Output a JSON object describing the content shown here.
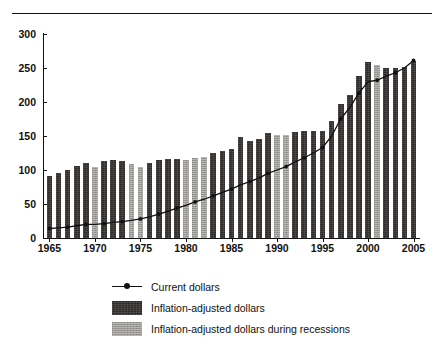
{
  "chart_data": {
    "type": "bar",
    "title": "",
    "subtitle": "",
    "xlabel": "",
    "ylabel": "",
    "xlim": [
      1964.4,
      2005.6
    ],
    "ylim": [
      0,
      300
    ],
    "grid": false,
    "legend_position": "bottom-left",
    "y_ticks": [
      0,
      50,
      100,
      150,
      200,
      250,
      300
    ],
    "x_ticks": [
      1965,
      1970,
      1975,
      1980,
      1985,
      1990,
      1995,
      2000,
      2005
    ],
    "x_tick_labels": [
      "1965",
      "1970",
      "1975",
      "1980",
      "1985",
      "1990",
      "1995",
      "2000",
      "2005"
    ],
    "y_tick_labels": [
      "0",
      "50",
      "100",
      "150",
      "200",
      "250",
      "300"
    ],
    "categories": [
      1965,
      1966,
      1967,
      1968,
      1969,
      1970,
      1971,
      1972,
      1973,
      1974,
      1975,
      1976,
      1977,
      1978,
      1979,
      1980,
      1981,
      1982,
      1983,
      1984,
      1985,
      1986,
      1987,
      1988,
      1989,
      1990,
      1991,
      1992,
      1993,
      1994,
      1995,
      1996,
      1997,
      1998,
      1999,
      2000,
      2001,
      2002,
      2003,
      2004,
      2005
    ],
    "series": [
      {
        "name": "Inflation-adjusted dollars",
        "type": "bar",
        "color": "#2e2b29",
        "values": [
          91,
          95,
          100,
          106,
          110,
          105,
          113,
          115,
          113,
          109,
          104,
          110,
          114,
          116,
          116,
          115,
          117,
          119,
          125,
          128,
          131,
          149,
          143,
          146,
          154,
          151,
          151,
          156,
          157,
          157,
          158,
          172,
          197,
          211,
          238,
          259,
          254,
          250,
          250,
          252,
          261
        ]
      },
      {
        "name": "Current dollars",
        "type": "line",
        "color": "#111111",
        "marker": "diamond",
        "values": [
          14,
          15,
          16,
          18,
          20,
          20,
          21,
          23,
          24,
          26,
          28,
          31,
          35,
          39,
          44,
          48,
          53,
          57,
          62,
          67,
          72,
          78,
          83,
          88,
          95,
          100,
          105,
          112,
          118,
          125,
          133,
          150,
          175,
          192,
          213,
          230,
          232,
          238,
          243,
          250,
          261
        ]
      }
    ],
    "recession_years": [
      1970,
      1974,
      1975,
      1980,
      1981,
      1982,
      1990,
      1991,
      2001
    ],
    "recession_series_name": "Inflation-adjusted dollars during recessions",
    "recession_color": "#9c9a97",
    "annotations": []
  },
  "legend": {
    "items": [
      {
        "label": "Current dollars",
        "key": "line-marker"
      },
      {
        "label": "Inflation-adjusted dollars",
        "key": "swatch-dark"
      },
      {
        "label": "Inflation-adjusted dollars during recessions",
        "key": "swatch-light"
      }
    ]
  }
}
